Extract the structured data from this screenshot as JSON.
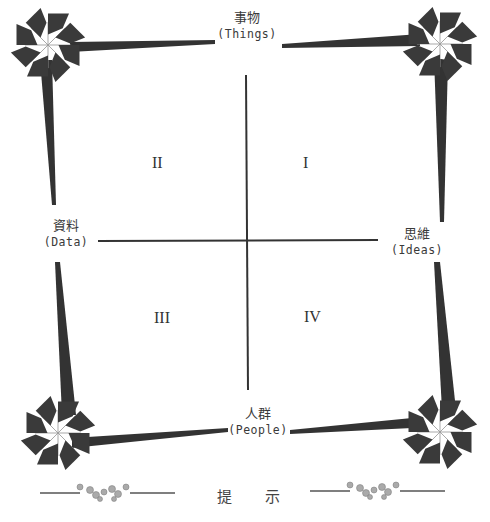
{
  "diagram": {
    "type": "quadrant",
    "axes": {
      "top": {
        "zh": "事物",
        "en": "(Things)"
      },
      "left": {
        "zh": "資料",
        "en": "(Data)"
      },
      "right": {
        "zh": "思維",
        "en": "(Ideas)"
      },
      "bottom": {
        "zh": "人群",
        "en": "(People)"
      }
    },
    "quadrants": [
      {
        "id": "I",
        "label": "I"
      },
      {
        "id": "II",
        "label": "II"
      },
      {
        "id": "III",
        "label": "III"
      },
      {
        "id": "IV",
        "label": "IV"
      }
    ],
    "footer": {
      "label": "提 示"
    },
    "decorations": [
      "pinwheel-top-left",
      "pinwheel-top-right",
      "pinwheel-bottom-left",
      "pinwheel-bottom-right",
      "floral-divider-left",
      "floral-divider-right"
    ],
    "colors": {
      "ink": "#333333",
      "shape": "#3a3a3a",
      "bead": "#9a9a9a"
    }
  }
}
